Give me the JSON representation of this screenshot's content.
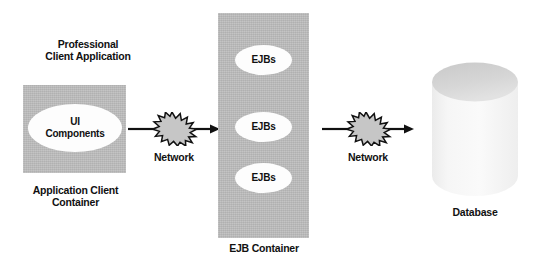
{
  "diagram": {
    "background_color": "#ffffff",
    "container_fill": "#bdbdbd",
    "ellipse_fill": "#fdfdfd",
    "line_color": "#111111"
  },
  "client_tier": {
    "title": "Professional\nClient Application",
    "component_label": "UI\nComponents",
    "container_caption": "Application Client\nContainer"
  },
  "ejb_tier": {
    "ejbs": [
      {
        "label": "EJBs"
      },
      {
        "label": "EJBs"
      },
      {
        "label": "EJBs"
      }
    ],
    "container_caption": "EJB Container"
  },
  "database_tier": {
    "caption": "Database"
  },
  "connectors": [
    {
      "label": "Network",
      "direction": "right"
    },
    {
      "label": "Network",
      "direction": "right"
    }
  ]
}
